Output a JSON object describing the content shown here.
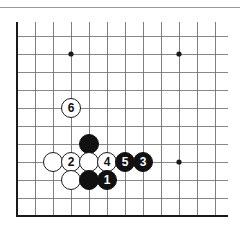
{
  "figure": {
    "kind": "go-board-diagram",
    "title": "",
    "top_rule": true,
    "colors": {
      "background": "#ffffff",
      "grid_line": "#6b6b6b",
      "border_line": "#1a1a1a",
      "black_stone": "#111111",
      "white_stone": "#ffffff",
      "black_label": "#ffffff",
      "white_label": "#111111"
    }
  },
  "board": {
    "origin_x": 17,
    "origin_y": 36,
    "spacing": 18,
    "cols": 12,
    "rows": 11,
    "left_edge_thick": true,
    "bottom_edge_thick": true,
    "bottom_y": 216,
    "star_points": [
      {
        "x": 71,
        "y": 54
      },
      {
        "x": 179,
        "y": 54
      },
      {
        "x": 179,
        "y": 162
      }
    ]
  },
  "stones": [
    {
      "color": "white",
      "label": "6",
      "x": 71,
      "y": 108,
      "name": "stone-white-6"
    },
    {
      "color": "black",
      "label": "",
      "x": 89,
      "y": 144,
      "name": "stone-black-plain-1"
    },
    {
      "color": "white",
      "label": "",
      "x": 53,
      "y": 162,
      "name": "stone-white-plain-1"
    },
    {
      "color": "white",
      "label": "2",
      "x": 71,
      "y": 162,
      "name": "stone-white-2"
    },
    {
      "color": "white",
      "label": "",
      "x": 89,
      "y": 162,
      "name": "stone-white-plain-2"
    },
    {
      "color": "white",
      "label": "4",
      "x": 107,
      "y": 162,
      "name": "stone-white-4"
    },
    {
      "color": "black",
      "label": "5",
      "x": 125,
      "y": 162,
      "name": "stone-black-5"
    },
    {
      "color": "black",
      "label": "3",
      "x": 143,
      "y": 162,
      "name": "stone-black-3"
    },
    {
      "color": "white",
      "label": "",
      "x": 71,
      "y": 180,
      "name": "stone-white-plain-3"
    },
    {
      "color": "black",
      "label": "",
      "x": 89,
      "y": 180,
      "name": "stone-black-plain-2"
    },
    {
      "color": "black",
      "label": "1",
      "x": 107,
      "y": 180,
      "name": "stone-black-1"
    }
  ]
}
